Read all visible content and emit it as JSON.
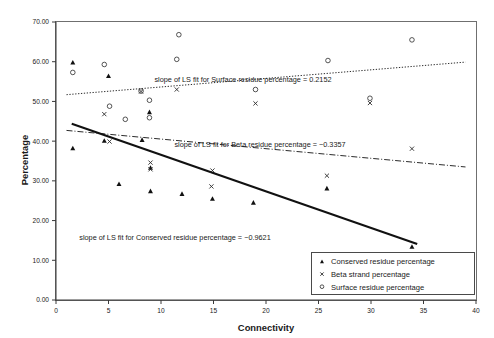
{
  "chart_data": {
    "type": "scatter",
    "title": "",
    "xlabel": "Connectivity",
    "ylabel": "Percentage",
    "xlim": [
      0,
      40
    ],
    "ylim": [
      0,
      70
    ],
    "xticks": [
      "0",
      "5",
      "10",
      "15",
      "20",
      "25",
      "30",
      "35",
      "40"
    ],
    "xtick_values": [
      0,
      5,
      10,
      15,
      20,
      25,
      30,
      35,
      40
    ],
    "yticks": [
      "0.00",
      "10.00",
      "20.00",
      "30.00",
      "40.00",
      "50.00",
      "60.00",
      "70.00"
    ],
    "ytick_values": [
      0,
      10,
      20,
      30,
      40,
      50,
      60,
      70
    ],
    "grid": false,
    "legend_position": "bottom-right",
    "series": [
      {
        "name": "Conserved residue  percentage",
        "marker": "triangle",
        "color": "#111111",
        "points": [
          [
            1.6,
            59.8
          ],
          [
            1.6,
            38.2
          ],
          [
            4.6,
            40.1
          ],
          [
            5.0,
            56.4
          ],
          [
            6.0,
            29.2
          ],
          [
            8.2,
            40.3
          ],
          [
            8.9,
            47.3
          ],
          [
            9.0,
            33.3
          ],
          [
            9.0,
            27.4
          ],
          [
            12.0,
            26.7
          ],
          [
            14.9,
            25.5
          ],
          [
            18.8,
            24.5
          ],
          [
            25.8,
            28.1
          ],
          [
            33.9,
            13.4
          ]
        ]
      },
      {
        "name": "Beta strand percentage",
        "marker": "cross",
        "color": "#2b2b2b",
        "points": [
          [
            4.6,
            46.8
          ],
          [
            5.1,
            39.9
          ],
          [
            8.1,
            52.5
          ],
          [
            9.0,
            34.6
          ],
          [
            9.0,
            32.9
          ],
          [
            11.5,
            53.0
          ],
          [
            14.9,
            32.6
          ],
          [
            14.8,
            28.6
          ],
          [
            19.0,
            49.5
          ],
          [
            25.8,
            31.3
          ],
          [
            29.9,
            49.6
          ],
          [
            33.9,
            38.1
          ]
        ]
      },
      {
        "name": "Surface residue percentage",
        "marker": "circle",
        "color": "#2b2b2b",
        "points": [
          [
            1.6,
            57.3
          ],
          [
            4.6,
            59.3
          ],
          [
            5.1,
            48.8
          ],
          [
            6.6,
            45.5
          ],
          [
            8.1,
            52.6
          ],
          [
            8.9,
            50.3
          ],
          [
            8.9,
            45.9
          ],
          [
            11.5,
            60.6
          ],
          [
            11.7,
            66.8
          ],
          [
            19.0,
            53.0
          ],
          [
            25.9,
            60.3
          ],
          [
            29.9,
            50.8
          ],
          [
            33.9,
            65.5
          ]
        ]
      }
    ],
    "fits": [
      {
        "name": "surface-fit",
        "style": "dotted",
        "x0": 1.0,
        "y0": 51.7,
        "x1": 39.0,
        "y1": 59.9
      },
      {
        "name": "beta-fit",
        "style": "dash-dot",
        "x0": 1.0,
        "y0": 42.7,
        "x1": 39.0,
        "y1": 33.5
      },
      {
        "name": "conserved-fit",
        "style": "solid",
        "x0": 1.5,
        "y0": 44.4,
        "x1": 34.4,
        "y1": 14.1
      }
    ],
    "annotations": [
      {
        "id": "surface-slope-annotation",
        "text": "slope of LS fit for Surface residue percentage = 0.2152",
        "x": 243,
        "y": 82
      },
      {
        "id": "beta-slope-annotation",
        "text": "slope of LS fit for Beta residue percentage = −0.3357",
        "x": 260,
        "y": 147
      },
      {
        "id": "conserved-slope-annotation",
        "text": "slope of LS fit for Conserved residue percentage  = −0.9621",
        "x": 175,
        "y": 240
      }
    ],
    "legend": {
      "entries": [
        {
          "label": "Conserved residue  percentage",
          "marker": "triangle"
        },
        {
          "label": "Beta strand percentage",
          "marker": "cross"
        },
        {
          "label": "Surface residue percentage",
          "marker": "circle"
        }
      ]
    }
  }
}
